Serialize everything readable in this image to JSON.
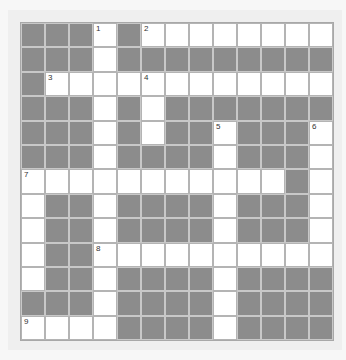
{
  "puzzle": {
    "type": "crossword",
    "rows": 13,
    "cols": 13,
    "colors": {
      "white_cell": "#ffffff",
      "black_cell": "#8c8c8c",
      "grid_line": "#c6c6c6",
      "background": "#efefef"
    },
    "grid": [
      "BBBWBWWWWWWWW",
      "BBBWBBBBBBBBB",
      "BWWWWWWWWWWWW",
      "BBBWBWBBBBBBB",
      "BBBWBWBBWBBBW",
      "BBBWBBBBWBBBW",
      "WWWWWWWWWWWBW",
      "WBBWBBBBWBBBW",
      "WBBWBBBBWBBBW",
      "WBBWWWWWWWWWW",
      "WBBWBBBBWBBBB",
      "BBBWBBBBWBBBB",
      "WWWWBBBBWBBBB"
    ],
    "numbers": [
      {
        "row": 0,
        "col": 3,
        "label": "1"
      },
      {
        "row": 0,
        "col": 5,
        "label": "2"
      },
      {
        "row": 2,
        "col": 1,
        "label": "3"
      },
      {
        "row": 2,
        "col": 5,
        "label": "4"
      },
      {
        "row": 4,
        "col": 8,
        "label": "5"
      },
      {
        "row": 4,
        "col": 12,
        "label": "6"
      },
      {
        "row": 6,
        "col": 0,
        "label": "7"
      },
      {
        "row": 9,
        "col": 3,
        "label": "8"
      },
      {
        "row": 12,
        "col": 0,
        "label": "9"
      }
    ]
  }
}
